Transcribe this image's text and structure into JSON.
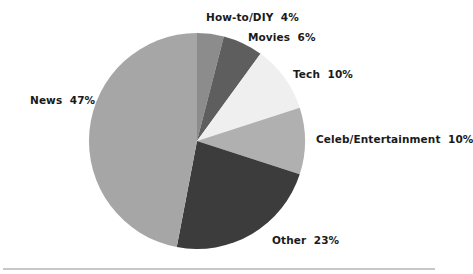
{
  "chart_data": {
    "type": "pie",
    "title": "",
    "start_angle": "12 o'clock",
    "direction": "clockwise",
    "slices": [
      {
        "label": "How-to/DIY",
        "value": 4,
        "color": "#8c8c8c",
        "display": "How-to/DIY  4%"
      },
      {
        "label": "Movies",
        "value": 6,
        "color": "#5e5e5e",
        "display": "Movies  6%"
      },
      {
        "label": "Tech",
        "value": 10,
        "color": "#efefef",
        "display": "Tech  10%"
      },
      {
        "label": "Celeb/Entertainment",
        "value": 10,
        "color": "#b0b0b0",
        "display": "Celeb/Entertainment  10%"
      },
      {
        "label": "Other",
        "value": 23,
        "color": "#3c3c3c",
        "display": "Other  23%"
      },
      {
        "label": "News",
        "value": 47,
        "color": "#a6a6a6",
        "display": "News  47%"
      }
    ],
    "categories": [
      "How-to/DIY",
      "Movies",
      "Tech",
      "Celeb/Entertainment",
      "Other",
      "News"
    ],
    "values": [
      4,
      6,
      10,
      10,
      23,
      47
    ],
    "unit": "%",
    "legend": "none (direct labels)"
  },
  "labels": {
    "howto": "How-to/DIY  4%",
    "movies": "Movies  6%",
    "tech": "Tech  10%",
    "celeb": "Celeb/Entertainment  10%",
    "other": "Other  23%",
    "news": "News  47%"
  }
}
